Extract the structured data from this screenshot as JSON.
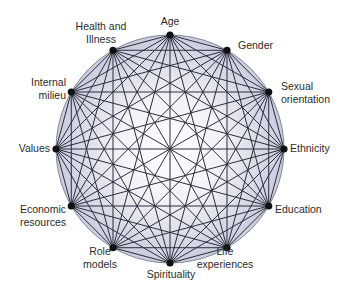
{
  "diagram": {
    "type": "complete-graph-circle",
    "fill_outer": "#c9ccdc",
    "fill_inner": "#ffffff",
    "edge_color": "#2a2d3a",
    "node_color": "#111111",
    "nodes": [
      {
        "id": "age",
        "lines": [
          "Age"
        ]
      },
      {
        "id": "gender",
        "lines": [
          "Gender"
        ]
      },
      {
        "id": "sexual-orientation",
        "lines": [
          "Sexual",
          "orientation"
        ]
      },
      {
        "id": "ethnicity",
        "lines": [
          "Ethnicity"
        ]
      },
      {
        "id": "education",
        "lines": [
          "Education"
        ]
      },
      {
        "id": "life-experiences",
        "lines": [
          "Life",
          "experiences"
        ]
      },
      {
        "id": "spirituality",
        "lines": [
          "Spirituality"
        ]
      },
      {
        "id": "role-models",
        "lines": [
          "Role",
          "models"
        ]
      },
      {
        "id": "economic-resources",
        "lines": [
          "Economic",
          "resources"
        ]
      },
      {
        "id": "values",
        "lines": [
          "Values"
        ]
      },
      {
        "id": "internal-milieu",
        "lines": [
          "Internal",
          "milieu"
        ]
      },
      {
        "id": "health-and-illness",
        "lines": [
          "Health and",
          "Illness"
        ]
      }
    ]
  }
}
